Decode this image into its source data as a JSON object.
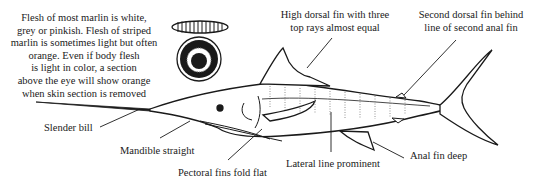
{
  "figure": {
    "colors": {
      "ink": "#1a1a1a",
      "background": "#ffffff"
    }
  },
  "flesh_note": {
    "lines": [
      "Flesh of most marlin is white,",
      "grey or pinkish. Flesh of striped",
      "marlin is sometimes light but often",
      "orange. Even if body flesh",
      "is light in color, a section",
      "above the eye will show orange",
      "when skin section is removed"
    ]
  },
  "cross_section_icon": "fish-cross-section-icon",
  "callouts": {
    "dorsal_fin": {
      "lines": [
        "High dorsal fin with three",
        "top rays almost equal"
      ]
    },
    "second_dorsal": {
      "lines": [
        "Second dorsal fin behind",
        "line of second anal fin"
      ]
    },
    "bill": {
      "text": "Slender bill"
    },
    "mandible": {
      "text": "Mandible straight"
    },
    "pectoral": {
      "text": "Pectoral fins fold flat"
    },
    "lateral_line": {
      "text": "Lateral line prominent"
    },
    "anal_fin": {
      "text": "Anal fin deep"
    }
  }
}
